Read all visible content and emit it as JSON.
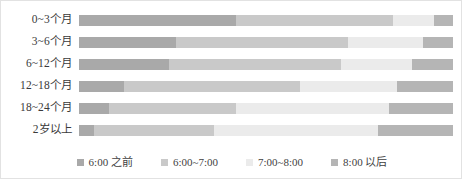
{
  "chart_data": {
    "type": "bar",
    "subtype": "horizontal-stacked-100-percent",
    "title": "",
    "xlabel": "",
    "ylabel": "",
    "grid": false,
    "xlim": [
      0,
      100
    ],
    "legend_position": "bottom",
    "categories": [
      "0~3个月",
      "3~6个月",
      "6~12个月",
      "12~18个月",
      "18~24个月",
      "2岁以上"
    ],
    "series": [
      {
        "name": "6:00 之前",
        "color": "#a9a9a9",
        "values": [
          42,
          26,
          24,
          12,
          8,
          4
        ]
      },
      {
        "name": "6:00~7:00",
        "color": "#c9c9c9",
        "values": [
          42,
          46,
          46,
          47,
          34,
          32
        ]
      },
      {
        "name": "7:00~8:00",
        "color": "#ebebeb",
        "values": [
          11,
          20,
          19,
          26,
          41,
          44
        ]
      },
      {
        "name": "8:00 以后",
        "color": "#b5b5b5",
        "values": [
          5,
          8,
          11,
          15,
          17,
          20
        ]
      }
    ]
  },
  "legend": {
    "items": [
      {
        "label": "6:00 之前",
        "color": "#a9a9a9"
      },
      {
        "label": "6:00~7:00",
        "color": "#c9c9c9"
      },
      {
        "label": "7:00~8:00",
        "color": "#ebebeb"
      },
      {
        "label": "8:00 以后",
        "color": "#b5b5b5"
      }
    ]
  }
}
